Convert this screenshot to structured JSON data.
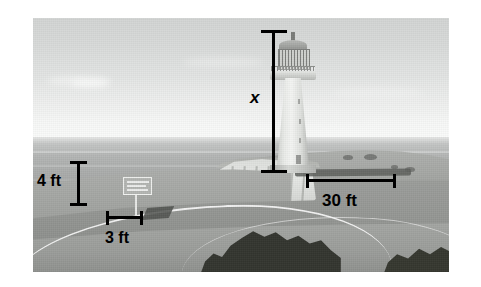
{
  "annotations": {
    "unknown_height": {
      "label": "x",
      "meaning": "unknown lighthouse height",
      "orientation": "vertical"
    },
    "sign_height": {
      "label": "4 ft",
      "value": 4,
      "unit": "ft",
      "orientation": "vertical"
    },
    "sign_shadow": {
      "label": "3 ft",
      "value": 3,
      "unit": "ft",
      "orientation": "horizontal"
    },
    "lighthouse_shadow": {
      "label": "30 ft",
      "value": 30,
      "unit": "ft",
      "orientation": "horizontal"
    }
  },
  "scene": {
    "objects": [
      "sky",
      "sea",
      "horizon",
      "chalk-cliff",
      "lighthouse",
      "grass-headland",
      "roadside-sign",
      "curving-path",
      "tree-clump",
      "fields"
    ],
    "sign_text_lines": [
      "",
      "",
      ""
    ]
  },
  "colors": {
    "annotation": "#000000",
    "sky_top": "#d3d5d4",
    "sky_horizon": "#fafbfa",
    "sea": "#a9abaa",
    "land": "#9b9d9a",
    "cliff": "#e6e8e5",
    "lighthouse": "#f4f5f3",
    "trees": "#33352f",
    "page_background": "#ffffff"
  }
}
